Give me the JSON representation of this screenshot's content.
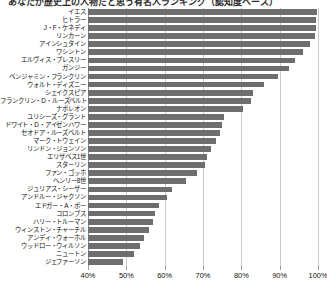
{
  "title": "あなたが歴史上の人物だと思う有名人ランキング（認知度ベース）",
  "chart_data": {
    "type": "bar",
    "orientation": "horizontal",
    "title": "あなたが歴史上の人物だと思う有名人ランキング（認知度ベース）",
    "xlabel": "",
    "ylabel": "",
    "xlim": [
      40,
      100
    ],
    "grid": true,
    "legend": false,
    "bar_color": "#6e6e6e",
    "xticks": [
      "40%",
      "50%",
      "60%",
      "70%",
      "80%",
      "90%",
      "100%"
    ],
    "xtick_values": [
      40,
      50,
      60,
      70,
      80,
      90,
      100
    ],
    "categories": [
      "イエス",
      "ヒトラー",
      "J・F・ケネディ",
      "リンカーン",
      "アインシュタイン",
      "ワシントン",
      "エルヴィス・プレスリー",
      "ガンジー",
      "ベンジャミン・フランクリン",
      "ウォルト・ディズニー",
      "シェイクスピア",
      "フランクリン・D・ルーズベルト",
      "ナポレオン",
      "ユリシーズ・グラント",
      "ドワイト・D・アイゼンハワー",
      "セオドア・ルーズベルト",
      "マーク・トウェイン",
      "リンドン・ジョンソン",
      "エリザベス1世",
      "スターリン",
      "ファン・ゴッホ",
      "ヘンリー8世",
      "ジュリアス・シーザー",
      "アンドルー・ジャクソン",
      "エドガー・A・ポー",
      "コロンブス",
      "ハリー・トルーマン",
      "ウィンストン・チャーチル",
      "アンディ・ウォーホル",
      "ウッドロー・ウィルソン",
      "ニュートン",
      "ジェファーソン"
    ],
    "values": [
      99.8,
      99.6,
      99.4,
      99.2,
      98.0,
      96.0,
      94.0,
      92.5,
      89.5,
      86.0,
      83.0,
      82.5,
      80.5,
      75.5,
      75.0,
      74.5,
      73.5,
      72.0,
      71.0,
      70.5,
      68.5,
      65.5,
      62.0,
      60.5,
      58.5,
      57.5,
      57.0,
      56.0,
      54.5,
      53.5,
      52.0,
      49.0
    ]
  }
}
